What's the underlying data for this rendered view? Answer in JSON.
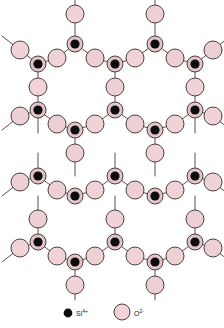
{
  "figure": {
    "title": "",
    "kind": "silica-network-schematic",
    "background_color": "#ffffff"
  },
  "colors": {
    "oxygen_fill": "#f0d3d6",
    "oxygen_fill_alt": "#ecd0d3",
    "oxygen_stroke": "#3a2b2b",
    "silicon_fill": "#0d0d0d",
    "silicon_ring_fill": "#e3c4c8",
    "silicon_ring_stroke": "#3a2b2b",
    "bond_stroke": "#4a3a3a",
    "legend_text": "#1a1a1a",
    "margin_text": "#b04a3a"
  },
  "geometry": {
    "oxygen_radius": 9.0,
    "silicon_outer_radius": 8.0,
    "silicon_inner_radius": 4.6,
    "bond_width": 0.9,
    "node_stroke_width": 0.9
  },
  "legend": {
    "items": [
      {
        "marker": "silicon-dot",
        "species": "Si",
        "charge": "4+",
        "label": "Si4+"
      },
      {
        "marker": "oxygen-circle",
        "species": "O",
        "charge": "2-",
        "label": "O2-"
      }
    ]
  },
  "margin_fragments": {
    "note": "clipped text fragments at right edge",
    "lines": [
      "",
      "",
      ""
    ]
  },
  "silicon_atoms": [
    {
      "x": 75,
      "y": 44
    },
    {
      "x": 155,
      "y": 44
    },
    {
      "x": 38,
      "y": 64
    },
    {
      "x": 115,
      "y": 64
    },
    {
      "x": 195,
      "y": 64
    },
    {
      "x": 38,
      "y": 110
    },
    {
      "x": 115,
      "y": 110
    },
    {
      "x": 195,
      "y": 110
    },
    {
      "x": 75,
      "y": 130
    },
    {
      "x": 155,
      "y": 130
    },
    {
      "x": 38,
      "y": 176
    },
    {
      "x": 115,
      "y": 176
    },
    {
      "x": 195,
      "y": 176
    },
    {
      "x": 75,
      "y": 196
    },
    {
      "x": 155,
      "y": 196
    },
    {
      "x": 38,
      "y": 242
    },
    {
      "x": 115,
      "y": 242
    },
    {
      "x": 195,
      "y": 242
    },
    {
      "x": 75,
      "y": 262
    },
    {
      "x": 155,
      "y": 262
    }
  ],
  "oxygen_atoms": [
    {
      "x": 75,
      "y": 14
    },
    {
      "x": 155,
      "y": 14
    },
    {
      "x": 57,
      "y": 58
    },
    {
      "x": 95,
      "y": 58
    },
    {
      "x": 135,
      "y": 58
    },
    {
      "x": 175,
      "y": 58
    },
    {
      "x": 20,
      "y": 50
    },
    {
      "x": 213,
      "y": 50
    },
    {
      "x": 38,
      "y": 87
    },
    {
      "x": 115,
      "y": 87
    },
    {
      "x": 195,
      "y": 87
    },
    {
      "x": 57,
      "y": 124
    },
    {
      "x": 95,
      "y": 124
    },
    {
      "x": 135,
      "y": 124
    },
    {
      "x": 175,
      "y": 124
    },
    {
      "x": 20,
      "y": 116
    },
    {
      "x": 213,
      "y": 116
    },
    {
      "x": 75,
      "y": 153
    },
    {
      "x": 155,
      "y": 153
    },
    {
      "x": 57,
      "y": 190
    },
    {
      "x": 95,
      "y": 190
    },
    {
      "x": 135,
      "y": 190
    },
    {
      "x": 175,
      "y": 190
    },
    {
      "x": 20,
      "y": 182
    },
    {
      "x": 213,
      "y": 182
    },
    {
      "x": 38,
      "y": 219
    },
    {
      "x": 115,
      "y": 219
    },
    {
      "x": 195,
      "y": 219
    },
    {
      "x": 57,
      "y": 256
    },
    {
      "x": 95,
      "y": 256
    },
    {
      "x": 135,
      "y": 256
    },
    {
      "x": 175,
      "y": 256
    },
    {
      "x": 20,
      "y": 248
    },
    {
      "x": 213,
      "y": 248
    },
    {
      "x": 75,
      "y": 285
    },
    {
      "x": 155,
      "y": 285
    }
  ],
  "bonds": [
    {
      "x1": 75,
      "y1": 14,
      "x2": 75,
      "y2": -4
    },
    {
      "x1": 155,
      "y1": 14,
      "x2": 155,
      "y2": -4
    },
    {
      "x1": 75,
      "y1": 14,
      "x2": 75,
      "y2": 44
    },
    {
      "x1": 155,
      "y1": 14,
      "x2": 155,
      "y2": 44
    },
    {
      "x1": 75,
      "y1": 44,
      "x2": 57,
      "y2": 58
    },
    {
      "x1": 75,
      "y1": 44,
      "x2": 95,
      "y2": 58
    },
    {
      "x1": 155,
      "y1": 44,
      "x2": 135,
      "y2": 58
    },
    {
      "x1": 155,
      "y1": 44,
      "x2": 175,
      "y2": 58
    },
    {
      "x1": 57,
      "y1": 58,
      "x2": 38,
      "y2": 64
    },
    {
      "x1": 95,
      "y1": 58,
      "x2": 115,
      "y2": 64
    },
    {
      "x1": 135,
      "y1": 58,
      "x2": 115,
      "y2": 64
    },
    {
      "x1": 175,
      "y1": 58,
      "x2": 195,
      "y2": 64
    },
    {
      "x1": 38,
      "y1": 64,
      "x2": 20,
      "y2": 50
    },
    {
      "x1": 20,
      "y1": 50,
      "x2": 2,
      "y2": 36
    },
    {
      "x1": 195,
      "y1": 64,
      "x2": 213,
      "y2": 50
    },
    {
      "x1": 213,
      "y1": 50,
      "x2": 228,
      "y2": 38
    },
    {
      "x1": 38,
      "y1": 64,
      "x2": 38,
      "y2": 87
    },
    {
      "x1": 115,
      "y1": 64,
      "x2": 115,
      "y2": 87
    },
    {
      "x1": 195,
      "y1": 64,
      "x2": 195,
      "y2": 87
    },
    {
      "x1": 38,
      "y1": 87,
      "x2": 38,
      "y2": 110
    },
    {
      "x1": 115,
      "y1": 87,
      "x2": 115,
      "y2": 110
    },
    {
      "x1": 195,
      "y1": 87,
      "x2": 195,
      "y2": 110
    },
    {
      "x1": 38,
      "y1": 110,
      "x2": 20,
      "y2": 116
    },
    {
      "x1": 20,
      "y1": 116,
      "x2": 2,
      "y2": 130
    },
    {
      "x1": 195,
      "y1": 110,
      "x2": 213,
      "y2": 116
    },
    {
      "x1": 213,
      "y1": 116,
      "x2": 228,
      "y2": 128
    },
    {
      "x1": 38,
      "y1": 110,
      "x2": 57,
      "y2": 124
    },
    {
      "x1": 115,
      "y1": 110,
      "x2": 95,
      "y2": 124
    },
    {
      "x1": 115,
      "y1": 110,
      "x2": 135,
      "y2": 124
    },
    {
      "x1": 195,
      "y1": 110,
      "x2": 175,
      "y2": 124
    },
    {
      "x1": 57,
      "y1": 124,
      "x2": 75,
      "y2": 130
    },
    {
      "x1": 95,
      "y1": 124,
      "x2": 75,
      "y2": 130
    },
    {
      "x1": 135,
      "y1": 124,
      "x2": 155,
      "y2": 130
    },
    {
      "x1": 175,
      "y1": 124,
      "x2": 155,
      "y2": 130
    },
    {
      "x1": 75,
      "y1": 130,
      "x2": 75,
      "y2": 153
    },
    {
      "x1": 155,
      "y1": 130,
      "x2": 155,
      "y2": 153
    },
    {
      "x1": 75,
      "y1": 153,
      "x2": 75,
      "y2": 176
    },
    {
      "x1": 155,
      "y1": 153,
      "x2": 155,
      "y2": 176
    },
    {
      "x1": 38,
      "y1": 176,
      "x2": 57,
      "y2": 190
    },
    {
      "x1": 115,
      "y1": 176,
      "x2": 95,
      "y2": 190
    },
    {
      "x1": 115,
      "y1": 176,
      "x2": 135,
      "y2": 190
    },
    {
      "x1": 195,
      "y1": 176,
      "x2": 175,
      "y2": 190
    },
    {
      "x1": 57,
      "y1": 190,
      "x2": 75,
      "y2": 196
    },
    {
      "x1": 95,
      "y1": 190,
      "x2": 75,
      "y2": 196
    },
    {
      "x1": 135,
      "y1": 190,
      "x2": 155,
      "y2": 196
    },
    {
      "x1": 175,
      "y1": 190,
      "x2": 155,
      "y2": 196
    },
    {
      "x1": 38,
      "y1": 176,
      "x2": 20,
      "y2": 182
    },
    {
      "x1": 20,
      "y1": 182,
      "x2": 2,
      "y2": 196
    },
    {
      "x1": 195,
      "y1": 176,
      "x2": 213,
      "y2": 182
    },
    {
      "x1": 213,
      "y1": 182,
      "x2": 228,
      "y2": 194
    },
    {
      "x1": 38,
      "y1": 176,
      "x2": 38,
      "y2": 153
    },
    {
      "x1": 115,
      "y1": 176,
      "x2": 115,
      "y2": 153
    },
    {
      "x1": 195,
      "y1": 176,
      "x2": 195,
      "y2": 153
    },
    {
      "x1": 38,
      "y1": 242,
      "x2": 38,
      "y2": 219
    },
    {
      "x1": 115,
      "y1": 242,
      "x2": 115,
      "y2": 219
    },
    {
      "x1": 195,
      "y1": 242,
      "x2": 195,
      "y2": 219
    },
    {
      "x1": 38,
      "y1": 219,
      "x2": 38,
      "y2": 196
    },
    {
      "x1": 115,
      "y1": 219,
      "x2": 115,
      "y2": 196
    },
    {
      "x1": 195,
      "y1": 219,
      "x2": 195,
      "y2": 196
    },
    {
      "x1": 38,
      "y1": 242,
      "x2": 20,
      "y2": 248
    },
    {
      "x1": 20,
      "y1": 248,
      "x2": 2,
      "y2": 262
    },
    {
      "x1": 195,
      "y1": 242,
      "x2": 213,
      "y2": 248
    },
    {
      "x1": 213,
      "y1": 248,
      "x2": 228,
      "y2": 260
    },
    {
      "x1": 38,
      "y1": 242,
      "x2": 57,
      "y2": 256
    },
    {
      "x1": 115,
      "y1": 242,
      "x2": 95,
      "y2": 256
    },
    {
      "x1": 115,
      "y1": 242,
      "x2": 135,
      "y2": 256
    },
    {
      "x1": 195,
      "y1": 242,
      "x2": 175,
      "y2": 256
    },
    {
      "x1": 57,
      "y1": 256,
      "x2": 75,
      "y2": 262
    },
    {
      "x1": 95,
      "y1": 256,
      "x2": 75,
      "y2": 262
    },
    {
      "x1": 135,
      "y1": 256,
      "x2": 155,
      "y2": 262
    },
    {
      "x1": 175,
      "y1": 256,
      "x2": 155,
      "y2": 262
    },
    {
      "x1": 75,
      "y1": 262,
      "x2": 75,
      "y2": 285
    },
    {
      "x1": 155,
      "y1": 262,
      "x2": 155,
      "y2": 285
    },
    {
      "x1": 75,
      "y1": 285,
      "x2": 75,
      "y2": 300
    },
    {
      "x1": 155,
      "y1": 285,
      "x2": 155,
      "y2": 300
    },
    {
      "x1": 38,
      "y1": 110,
      "x2": 38,
      "y2": 133
    },
    {
      "x1": 195,
      "y1": 110,
      "x2": 195,
      "y2": 133
    }
  ],
  "legend_layout": {
    "si_marker": {
      "x": 68,
      "y": 313,
      "r": 4.4
    },
    "si_label": {
      "x": 76,
      "y": 316
    },
    "o_marker": {
      "x": 122,
      "y": 312,
      "r": 8.0
    },
    "o_label": {
      "x": 134,
      "y": 316
    }
  }
}
